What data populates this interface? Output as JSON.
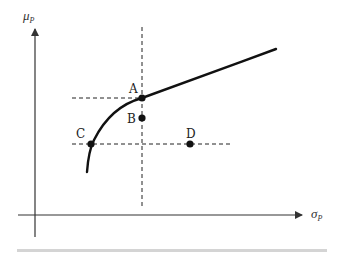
{
  "diagram": {
    "title": "",
    "y_axis": {
      "label": "μ",
      "subscript": "P"
    },
    "x_axis": {
      "label": "σ",
      "subscript": "P"
    },
    "points": [
      {
        "name": "A",
        "x": 142,
        "y": 98,
        "label_dx": -12,
        "label_dy": -4
      },
      {
        "name": "B",
        "x": 142,
        "y": 118,
        "label_dx": -13,
        "label_dy": 5
      },
      {
        "name": "C",
        "x": 91,
        "y": 144,
        "label_dx": -13,
        "label_dy": -6
      },
      {
        "name": "D",
        "x": 190,
        "y": 144,
        "label_dx": -4,
        "label_dy": -6
      }
    ],
    "curve": "efficient frontier",
    "colors": {
      "ink": "#111111",
      "axis": "#333333",
      "bar": "#d4d4d4"
    }
  }
}
